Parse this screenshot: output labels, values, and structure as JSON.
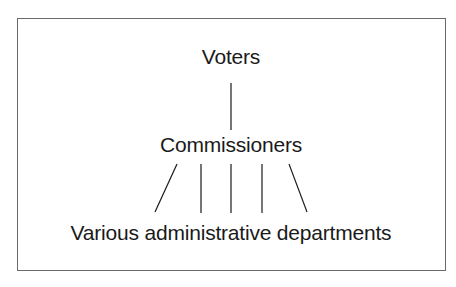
{
  "diagram": {
    "type": "hierarchy",
    "nodes": {
      "top": "Voters",
      "middle": "Commissioners",
      "bottom": "Various administrative departments"
    },
    "edges": [
      {
        "from": "Voters",
        "to": "Commissioners",
        "count": 1
      },
      {
        "from": "Commissioners",
        "to": "Various administrative departments",
        "count": 5
      }
    ],
    "colors": {
      "line": "#1a1a1a",
      "border": "#6a6a6a",
      "background": "#ffffff"
    }
  }
}
